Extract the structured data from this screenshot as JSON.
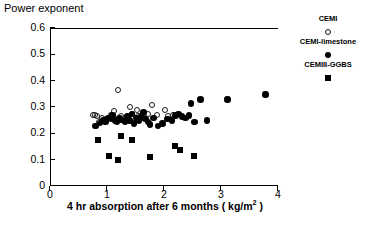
{
  "chart_data": {
    "type": "scatter",
    "title": "",
    "xlabel": "4 hr absorption after 6 months ( kg/m2 )",
    "xlabel_prefix": "4 hr absorption after 6 months ( kg/m",
    "xlabel_sup": "2",
    "xlabel_suffix": " )",
    "ylabel": "Power exponent",
    "xlim": [
      0,
      4
    ],
    "ylim": [
      0,
      0.6
    ],
    "xticks": [
      "0",
      "1",
      "2",
      "3",
      "4"
    ],
    "xtick_values": [
      0,
      1,
      2,
      3,
      4
    ],
    "yticks": [
      "0",
      "0.1",
      "0.2",
      "0.3",
      "0.4",
      "0.5",
      "0.6"
    ],
    "ytick_values": [
      0,
      0.1,
      0.2,
      0.3,
      0.4,
      0.5,
      0.6
    ],
    "grid": false,
    "legend_position": "right",
    "series": [
      {
        "name": "CEMI",
        "marker": "circle-open",
        "color": "#1a1a1a",
        "points": [
          [
            0.74,
            0.275
          ],
          [
            0.77,
            0.272
          ],
          [
            0.8,
            0.268
          ],
          [
            0.84,
            0.247
          ],
          [
            0.9,
            0.262
          ],
          [
            0.97,
            0.258
          ],
          [
            1.05,
            0.272
          ],
          [
            1.1,
            0.287
          ],
          [
            1.18,
            0.367
          ],
          [
            1.22,
            0.268
          ],
          [
            1.3,
            0.252
          ],
          [
            1.38,
            0.305
          ],
          [
            1.42,
            0.277
          ],
          [
            1.5,
            0.292
          ],
          [
            1.52,
            0.268
          ],
          [
            1.6,
            0.262
          ],
          [
            1.7,
            0.278
          ],
          [
            1.78,
            0.313
          ],
          [
            1.86,
            0.272
          ],
          [
            2.0,
            0.292
          ],
          [
            2.06,
            0.268
          ],
          [
            2.14,
            0.275
          ]
        ]
      },
      {
        "name": "CEMI-limestone",
        "marker": "circle-filled",
        "color": "#000000",
        "points": [
          [
            0.78,
            0.232
          ],
          [
            0.86,
            0.243
          ],
          [
            0.92,
            0.252
          ],
          [
            0.96,
            0.247
          ],
          [
            1.0,
            0.262
          ],
          [
            1.05,
            0.258
          ],
          [
            1.08,
            0.272
          ],
          [
            1.12,
            0.252
          ],
          [
            1.16,
            0.248
          ],
          [
            1.2,
            0.262
          ],
          [
            1.24,
            0.255
          ],
          [
            1.3,
            0.247
          ],
          [
            1.34,
            0.268
          ],
          [
            1.38,
            0.252
          ],
          [
            1.42,
            0.278
          ],
          [
            1.46,
            0.242
          ],
          [
            1.5,
            0.262
          ],
          [
            1.54,
            0.252
          ],
          [
            1.58,
            0.268
          ],
          [
            1.62,
            0.282
          ],
          [
            1.66,
            0.258
          ],
          [
            1.7,
            0.247
          ],
          [
            1.74,
            0.238
          ],
          [
            1.8,
            0.262
          ],
          [
            1.88,
            0.232
          ],
          [
            1.96,
            0.242
          ],
          [
            2.04,
            0.258
          ],
          [
            2.12,
            0.252
          ],
          [
            2.18,
            0.272
          ],
          [
            2.24,
            0.278
          ],
          [
            2.3,
            0.268
          ],
          [
            2.36,
            0.262
          ],
          [
            2.42,
            0.272
          ],
          [
            2.46,
            0.318
          ],
          [
            2.52,
            0.247
          ],
          [
            2.62,
            0.332
          ],
          [
            2.74,
            0.252
          ],
          [
            3.1,
            0.332
          ],
          [
            3.76,
            0.352
          ]
        ]
      },
      {
        "name": "CEMIII-GGBS",
        "marker": "square-filled",
        "color": "#000000",
        "points": [
          [
            0.82,
            0.178
          ],
          [
            1.02,
            0.118
          ],
          [
            1.18,
            0.102
          ],
          [
            1.22,
            0.192
          ],
          [
            1.42,
            0.178
          ],
          [
            1.74,
            0.114
          ],
          [
            2.18,
            0.155
          ],
          [
            2.26,
            0.142
          ],
          [
            2.5,
            0.118
          ]
        ]
      }
    ],
    "legend": [
      {
        "label": "CEMI",
        "marker": "circle-open"
      },
      {
        "label": "CEMI-limestone",
        "marker": "circle-filled"
      },
      {
        "label": "CEMIII-GGBS",
        "marker": "square-filled"
      }
    ]
  }
}
